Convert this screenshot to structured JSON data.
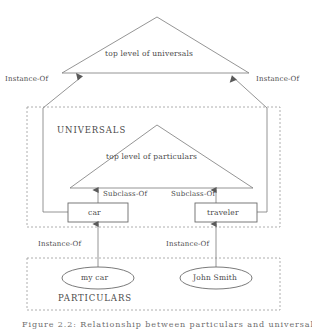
{
  "figure": {
    "caption": "Figure 2.2: Relationship between particulars and universals"
  },
  "zones": [
    {
      "id": "universals",
      "label": "UNIVERSALS"
    },
    {
      "id": "particulars",
      "label": "PARTICULARS"
    }
  ],
  "triangles": [
    {
      "id": "outer-triangle",
      "label": "top level of universals"
    },
    {
      "id": "inner-triangle",
      "label": "top level of particulars"
    }
  ],
  "class_boxes": [
    {
      "id": "car-box",
      "label": "car"
    },
    {
      "id": "traveler-box",
      "label": "traveler"
    }
  ],
  "instance_ovals": [
    {
      "id": "my-car-oval",
      "label": "my car"
    },
    {
      "id": "john-smith-oval",
      "label": "John Smith"
    }
  ],
  "edge_labels": {
    "instance_of_universals_left": "Instance-Of",
    "instance_of_universals_right": "Instance-Of",
    "subclass_of_left": "Subclass-Of",
    "subclass_of_right": "Subclass-Of",
    "instance_of_particulars_left": "Instance-Of",
    "instance_of_particulars_right": "Instance-Of"
  },
  "style": {
    "stroke": "#6b6b6b",
    "dashed_stroke": "#8a8a8a",
    "text": "#4a4a4a",
    "background": "#ffffff"
  }
}
